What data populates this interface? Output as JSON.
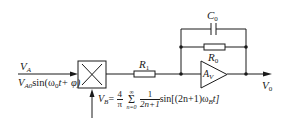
{
  "diagram": {
    "type": "circuit",
    "input_a": {
      "label": "V",
      "label_sub": "A",
      "expression_prefix": "V",
      "expression_sub": "A0",
      "expression_body": "sin(ω",
      "expression_omega_sub": "0",
      "expression_tail": "t+ φ)"
    },
    "multiplier": {
      "symbol": "×"
    },
    "input_b": {
      "label": "V",
      "label_sub": "B",
      "equals": "=",
      "coef_num": "4",
      "coef_den": "π",
      "sum_top": "∞",
      "sum_symbol": "Σ",
      "sum_bottom": "n=0",
      "term_num": "1",
      "term_den": "2n+1",
      "term_func": "sin[(2n+1)ω",
      "term_omega_sub": "B",
      "term_tail": "t]"
    },
    "r1": {
      "label": "R",
      "sub": "1"
    },
    "c0": {
      "label": "C",
      "sub": "0"
    },
    "r0": {
      "label": "R",
      "sub": "0"
    },
    "amplifier": {
      "label": "A",
      "sub": "V"
    },
    "output": {
      "label": "V",
      "sub": "0"
    }
  }
}
